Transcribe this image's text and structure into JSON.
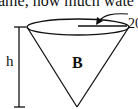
{
  "question_fragment": "ame, how much wate",
  "diagram": {
    "shape": "inverted cone",
    "labels": {
      "radius": "20",
      "height": "h",
      "cone": "B"
    },
    "stroke_color": "#111111"
  }
}
